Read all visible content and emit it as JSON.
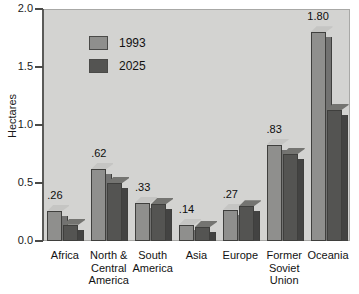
{
  "chart_data": {
    "type": "bar",
    "title": "",
    "subtitle": "",
    "xlabel": "",
    "ylabel": "Hectares",
    "ylim": [
      0.0,
      2.0
    ],
    "ytick_labels": [
      "2.0",
      "1.5",
      "1.0",
      "0.5",
      "0.0"
    ],
    "ytick_values": [
      2.0,
      1.5,
      1.0,
      0.5,
      0.0
    ],
    "grid": false,
    "legend_position": "upper-left-inside",
    "categories": [
      "Africa",
      "North & Central America",
      "South America",
      "Asia",
      "Europe",
      "Former Soviet Union",
      "Oceania"
    ],
    "category_lines": [
      [
        "Africa"
      ],
      [
        "North &",
        "Central",
        "America"
      ],
      [
        "South",
        "America"
      ],
      [
        "Asia"
      ],
      [
        "Europe"
      ],
      [
        "Former",
        "Soviet",
        "Union"
      ],
      [
        "Oceania"
      ]
    ],
    "series": [
      {
        "name": "1993",
        "color": "#8f8f8d",
        "values": [
          0.26,
          0.62,
          0.33,
          0.14,
          0.27,
          0.83,
          1.8
        ]
      },
      {
        "name": "2025",
        "color": "#545452",
        "values": [
          0.14,
          0.5,
          0.32,
          0.12,
          0.3,
          0.75,
          1.13
        ]
      }
    ],
    "annotations": [
      {
        "category": "Africa",
        "series": "1993",
        "text": ".26"
      },
      {
        "category": "North & Central America",
        "series": "1993",
        "text": ".62"
      },
      {
        "category": "South America",
        "series": "1993",
        "text": ".33"
      },
      {
        "category": "Asia",
        "series": "1993",
        "text": ".14"
      },
      {
        "category": "Europe",
        "series": "1993",
        "text": ".27"
      },
      {
        "category": "Former Soviet Union",
        "series": "1993",
        "text": ".83"
      },
      {
        "category": "Oceania",
        "series": "1993",
        "text": "1.80"
      }
    ],
    "plot_background": "#d3d3d1",
    "axis_color": "#4a4a48"
  },
  "legend": {
    "items": [
      {
        "label": "1993",
        "color": "#8f8f8d"
      },
      {
        "label": "2025",
        "color": "#545452"
      }
    ]
  },
  "axis": {
    "y_title": "Hectares",
    "y_labels": [
      "2.0",
      "1.5",
      "1.0",
      "0.5",
      "0.0"
    ]
  }
}
